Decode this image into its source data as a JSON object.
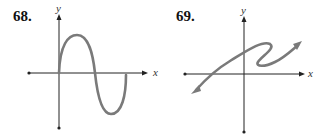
{
  "problems": [
    {
      "number": "68.",
      "x_label": "x",
      "y_label": "y"
    },
    {
      "number": "69.",
      "x_label": "x",
      "y_label": "y"
    }
  ],
  "colors": {
    "axis": "#222222",
    "curve": "#7a7a7a"
  }
}
